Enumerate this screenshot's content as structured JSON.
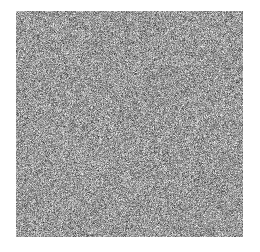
{
  "figure": {
    "title": "",
    "background_color": "#ffffff",
    "canvas_width": 260,
    "canvas_height": 252
  },
  "noise_patch": {
    "label": "random-grayscale-noise-patch",
    "x": 16,
    "y": 11,
    "width": 227,
    "height": 226,
    "grain_px": 1,
    "colorspace": "grayscale",
    "min_level": 0,
    "max_level": 255,
    "mean_level": 154,
    "std_level": 62,
    "mean_color": "#9a9a9a",
    "dark_color": "#151515",
    "light_color": "#ededed",
    "seed": 20240517,
    "border": "none"
  },
  "chart_data": {
    "type": "heatmap",
    "title": "",
    "subtitle": "",
    "xlabel": "",
    "ylabel": "",
    "grid": false,
    "legend": false,
    "legend_position": "none",
    "colormap": "gray",
    "annotations": [],
    "xtick_labels": [],
    "ytick_labels": [],
    "xlim": [
      0,
      227
    ],
    "ylim": [
      0,
      226
    ],
    "rows": 226,
    "cols": 227,
    "value_range": [
      0,
      255
    ],
    "distribution": "uniform-random",
    "mean": 154,
    "std": 62
  }
}
